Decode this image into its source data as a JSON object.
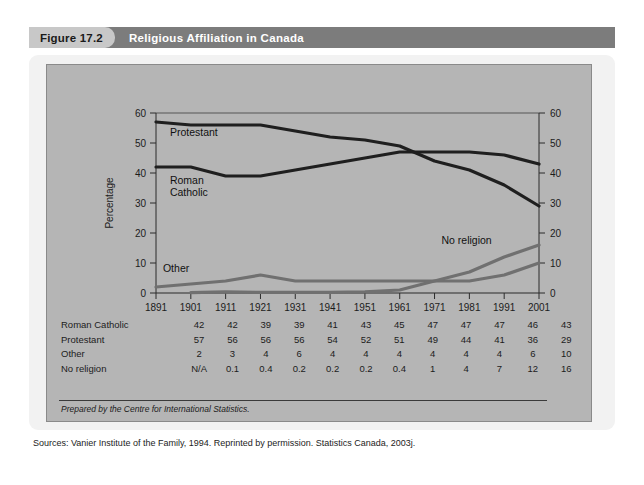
{
  "figure": {
    "number": "Figure 17.2",
    "title": "Religious Affiliation in Canada"
  },
  "chart_data": {
    "type": "line",
    "title": "Religious Affiliation in Canada",
    "xlabel": "",
    "ylabel": "Percentage",
    "ylim": [
      0,
      60
    ],
    "yticks": [
      0,
      10,
      20,
      30,
      40,
      50,
      60
    ],
    "right_axis": true,
    "grid": false,
    "legend": "inline-labels",
    "categories": [
      "1891",
      "1901",
      "1911",
      "1921",
      "1931",
      "1941",
      "1951",
      "1961",
      "1971",
      "1981",
      "1991",
      "2001"
    ],
    "series": [
      {
        "name": "Roman Catholic",
        "color": "#1f1f1f",
        "values": [
          42,
          42,
          39,
          39,
          41,
          43,
          45,
          47,
          47,
          47,
          46,
          43
        ]
      },
      {
        "name": "Protestant",
        "color": "#1f1f1f",
        "values": [
          57,
          56,
          56,
          56,
          54,
          52,
          51,
          49,
          44,
          41,
          36,
          29
        ]
      },
      {
        "name": "Other",
        "color": "#707070",
        "values": [
          2,
          3,
          4,
          6,
          4,
          4,
          4,
          4,
          4,
          4,
          6,
          10
        ]
      },
      {
        "name": "No religion",
        "color": "#707070",
        "values": [
          null,
          0.1,
          0.4,
          0.2,
          0.2,
          0.2,
          0.4,
          1,
          4,
          7,
          12,
          16
        ]
      }
    ],
    "annotations": [
      {
        "text": "Protestant",
        "x": 1895,
        "y": 52.5
      },
      {
        "text": "Roman Catholic",
        "x": 1895,
        "y": 36.5
      },
      {
        "text": "Other",
        "x": 1893,
        "y": 7.0
      },
      {
        "text": "No religion",
        "x": 1973,
        "y": 16.5
      }
    ]
  },
  "table": {
    "rows": [
      {
        "label": "Roman Catholic",
        "values": [
          "42",
          "42",
          "39",
          "39",
          "41",
          "43",
          "45",
          "47",
          "47",
          "47",
          "46",
          "43"
        ]
      },
      {
        "label": "Protestant",
        "values": [
          "57",
          "56",
          "56",
          "56",
          "54",
          "52",
          "51",
          "49",
          "44",
          "41",
          "36",
          "29"
        ]
      },
      {
        "label": "Other",
        "values": [
          "2",
          "3",
          "4",
          "6",
          "4",
          "4",
          "4",
          "4",
          "4",
          "4",
          "6",
          "10"
        ]
      },
      {
        "label": "No religion",
        "values": [
          "N/A",
          "0.1",
          "0.4",
          "0.2",
          "0.2",
          "0.2",
          "0.4",
          "1",
          "4",
          "7",
          "12",
          "16"
        ]
      }
    ]
  },
  "prepared_note": "Prepared by the Centre for International Statistics.",
  "sources": "Sources: Vanier Institute of the Family, 1994. Reprinted by permission. Statistics Canada, 2003j."
}
